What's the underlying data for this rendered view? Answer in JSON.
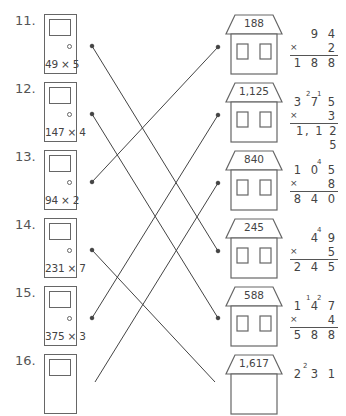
{
  "worksheet": {
    "problems": [
      {
        "number": "11.",
        "expression": "49 × 5"
      },
      {
        "number": "12.",
        "expression": "147 × 4"
      },
      {
        "number": "13.",
        "expression": "94 × 2"
      },
      {
        "number": "14.",
        "expression": "231 × 7"
      },
      {
        "number": "15.",
        "expression": "375 × 3"
      },
      {
        "number": "16.",
        "expression": ""
      }
    ],
    "houses": [
      {
        "answer": "188"
      },
      {
        "answer": "1,125"
      },
      {
        "answer": "840"
      },
      {
        "answer": "245"
      },
      {
        "answer": "588"
      },
      {
        "answer": "1,617"
      }
    ],
    "calculations": [
      {
        "top": "9 4",
        "carries": [],
        "multiplier": "2",
        "result": "1 8 8",
        "times_sign": "×"
      },
      {
        "top": "3 7 5",
        "carries": [
          "2",
          "1"
        ],
        "multiplier": "3",
        "result": "1, 1 2 5",
        "times_sign": "×"
      },
      {
        "top": "1 0 5",
        "carries": [
          "4"
        ],
        "multiplier": "8",
        "result": "8 4 0",
        "times_sign": "×"
      },
      {
        "top": "4 9",
        "carries": [
          "4"
        ],
        "multiplier": "5",
        "result": "2 4 5",
        "times_sign": "×"
      },
      {
        "top": "1 4 7",
        "carries": [
          "1",
          "2"
        ],
        "multiplier": "4",
        "result": "5 8 8",
        "times_sign": "×"
      },
      {
        "top": "2 3 1",
        "carries": [
          "2"
        ],
        "multiplier": "",
        "result": "",
        "times_sign": ""
      }
    ],
    "connections": [
      {
        "from_problem": "11.",
        "to_answer": "245"
      },
      {
        "from_problem": "12.",
        "to_answer": "588"
      },
      {
        "from_problem": "13.",
        "to_answer": "188"
      },
      {
        "from_problem": "14.",
        "to_answer": "1,617"
      },
      {
        "from_problem": "15.",
        "to_answer": "1,125"
      },
      {
        "from_problem": "16.",
        "to_answer": "840"
      }
    ],
    "colors": {
      "line": "#444444",
      "outline": "#666666",
      "text": "#444444"
    }
  }
}
